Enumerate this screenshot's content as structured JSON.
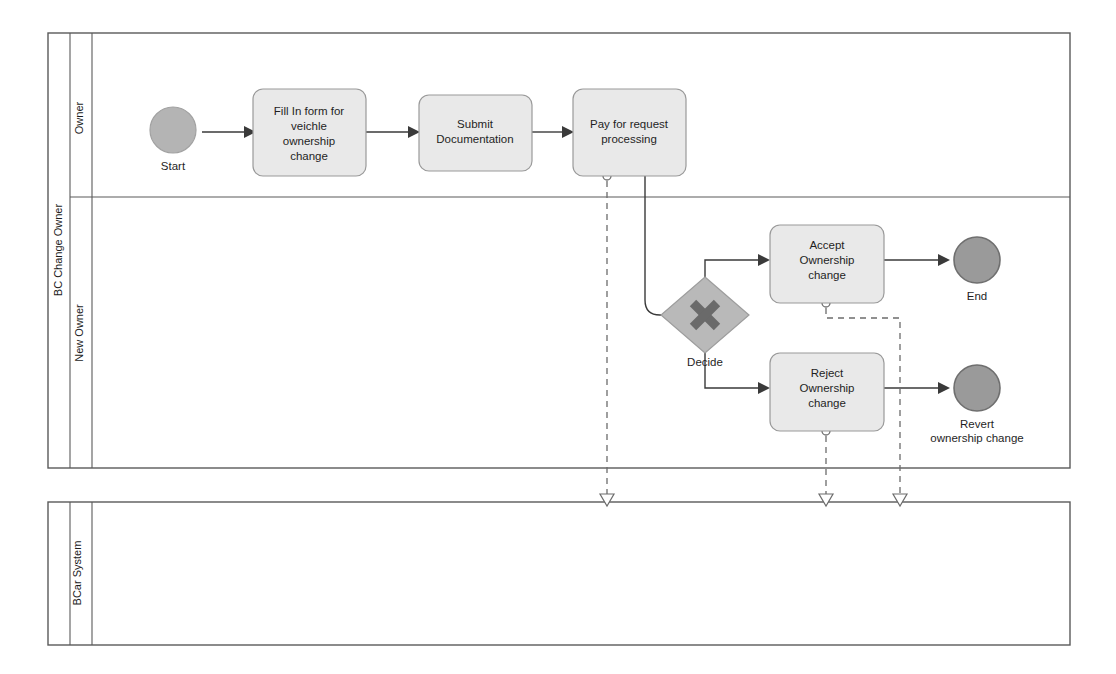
{
  "diagram": {
    "type": "bpmn-collaboration",
    "colors": {
      "task_fill": "#e9e9e9",
      "task_stroke": "#9a9a9a",
      "start_event_fill": "#b4b4b4",
      "end_event_fill": "#9a9a9a",
      "gateway_fill": "#b9b9b9",
      "gateway_marker": "#6a6a6a",
      "sequence_flow": "#3a3a3a",
      "message_flow": "#6c6c6c",
      "pool_stroke": "#5a5a5a",
      "background": "#ffffff"
    }
  },
  "pools": [
    {
      "id": "pool-bc-change-owner",
      "label": "BC Change Owner",
      "lanes": [
        {
          "id": "lane-owner",
          "label": "Owner"
        },
        {
          "id": "lane-new-owner",
          "label": "New Owner"
        }
      ]
    },
    {
      "id": "pool-bcar-system",
      "label": "BCar System",
      "lanes": []
    }
  ],
  "events": [
    {
      "id": "event-start",
      "kind": "start",
      "label": "Start",
      "lane": "Owner"
    },
    {
      "id": "event-end",
      "kind": "end",
      "label": "End",
      "lane": "New Owner"
    },
    {
      "id": "event-revert",
      "kind": "end",
      "label": "Revert\nownership change",
      "label_line1": "Revert",
      "label_line2": "ownership change",
      "lane": "New Owner"
    }
  ],
  "tasks": [
    {
      "id": "task-fill-form",
      "lane": "Owner",
      "label": "Fill In  form for veichle ownership change",
      "lines": [
        "Fill In  form for",
        "veichle",
        "ownership",
        "change"
      ]
    },
    {
      "id": "task-submit-documentation",
      "lane": "Owner",
      "label": "Submit Documentation",
      "lines": [
        "Submit",
        "Documentation"
      ]
    },
    {
      "id": "task-pay-request",
      "lane": "Owner",
      "label": "Pay for request processing",
      "lines": [
        "Pay for request",
        "processing"
      ]
    },
    {
      "id": "task-accept-ownership",
      "lane": "New Owner",
      "label": "Accept Ownership change",
      "lines": [
        "Accept",
        "Ownership",
        "change"
      ]
    },
    {
      "id": "task-reject-ownership",
      "lane": "New Owner",
      "label": "Reject Ownership change",
      "lines": [
        "Reject",
        "Ownership",
        "change"
      ]
    }
  ],
  "gateways": [
    {
      "id": "gateway-decide",
      "kind": "exclusive",
      "marker": "x-marker",
      "label": "Decide",
      "lane": "New Owner"
    }
  ],
  "flows": {
    "sequence": [
      {
        "from": "event-start",
        "to": "task-fill-form"
      },
      {
        "from": "task-fill-form",
        "to": "task-submit-documentation"
      },
      {
        "from": "task-submit-documentation",
        "to": "task-pay-request"
      },
      {
        "from": "task-pay-request",
        "to": "gateway-decide"
      },
      {
        "from": "gateway-decide",
        "to": "task-accept-ownership"
      },
      {
        "from": "gateway-decide",
        "to": "task-reject-ownership"
      },
      {
        "from": "task-accept-ownership",
        "to": "event-end"
      },
      {
        "from": "task-reject-ownership",
        "to": "event-revert"
      }
    ],
    "message": [
      {
        "from": "task-pay-request",
        "to": "pool-bcar-system"
      },
      {
        "from": "task-accept-ownership",
        "to": "pool-bcar-system"
      },
      {
        "from": "task-reject-ownership",
        "to": "pool-bcar-system"
      }
    ]
  }
}
